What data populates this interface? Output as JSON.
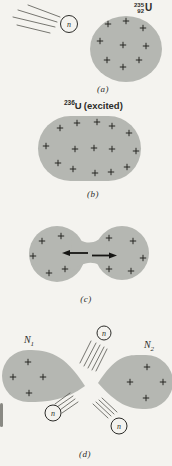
{
  "colors": {
    "background": "#f4f3ef",
    "nucleus_gray": "#b5b7b2",
    "ink": "#2c2c29",
    "motion_line": "#55554f"
  },
  "panels": {
    "a": {
      "caption": "(a)",
      "isotope": {
        "mass_number": "235",
        "atomic_number": "92",
        "symbol": "U"
      },
      "neutron_label": "n",
      "charges": [
        [
          108,
          24
        ],
        [
          126,
          21
        ],
        [
          143,
          28
        ],
        [
          100,
          41
        ],
        [
          123,
          45
        ],
        [
          146,
          46
        ],
        [
          107,
          60
        ],
        [
          123,
          67
        ],
        [
          139,
          60
        ]
      ]
    },
    "b": {
      "caption": "(b)",
      "isotope": {
        "mass_number": "236",
        "symbol": "U",
        "state": "(excited)"
      },
      "charges": [
        [
          60,
          128
        ],
        [
          77,
          123
        ],
        [
          97,
          122
        ],
        [
          112,
          126
        ],
        [
          129,
          133
        ],
        [
          46,
          146
        ],
        [
          75,
          149
        ],
        [
          94,
          148
        ],
        [
          112,
          149
        ],
        [
          136,
          151
        ],
        [
          58,
          163
        ],
        [
          73,
          169
        ],
        [
          95,
          173
        ],
        [
          111,
          172
        ],
        [
          127,
          167
        ]
      ]
    },
    "c": {
      "caption": "(c)",
      "charges_left": [
        [
          42,
          241
        ],
        [
          61,
          236
        ],
        [
          33,
          256
        ],
        [
          49,
          273
        ],
        [
          65,
          269
        ]
      ],
      "charges_right": [
        [
          109,
          238
        ],
        [
          133,
          241
        ],
        [
          143,
          258
        ],
        [
          109,
          269
        ],
        [
          131,
          271
        ]
      ]
    },
    "d": {
      "caption": "(d)",
      "fragment_left": {
        "label": "N",
        "sub": "1"
      },
      "fragment_right": {
        "label": "N",
        "sub": "2"
      },
      "neutrons": {
        "top": "n",
        "bottom_left": "n",
        "bottom_right": "n"
      },
      "charges_left": [
        [
          28,
          362
        ],
        [
          13,
          377
        ],
        [
          43,
          377
        ],
        [
          29,
          393
        ]
      ],
      "charges_right": [
        [
          147,
          367
        ],
        [
          130,
          382
        ],
        [
          163,
          382
        ],
        [
          146,
          398
        ]
      ]
    }
  }
}
